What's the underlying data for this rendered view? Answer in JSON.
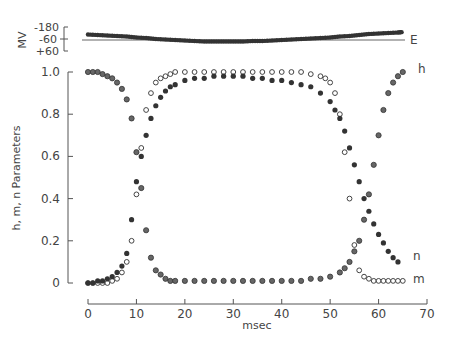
{
  "chart_data": {
    "type": "scatter",
    "title": "",
    "xlabel": "msec",
    "ylabel": "h, m, n  Parameters",
    "xlim": [
      0,
      70
    ],
    "ylim": [
      0,
      1.0
    ],
    "x_ticks": [
      "0",
      "10",
      "20",
      "30",
      "40",
      "50",
      "60",
      "70"
    ],
    "y_ticks": [
      "0",
      "0.2",
      "0.4",
      "0.6",
      "0.8",
      "1.0"
    ],
    "grid": false,
    "legend": "inline labels at right ends of curves",
    "series": [
      {
        "name": "h",
        "marker": "half-filled circle",
        "x": [
          0,
          1,
          2,
          3,
          4,
          5,
          6,
          7,
          8,
          9,
          10,
          11,
          12,
          13,
          14,
          15,
          16,
          17,
          18,
          20,
          22,
          24,
          26,
          28,
          30,
          32,
          34,
          36,
          38,
          40,
          42,
          44,
          46,
          48,
          50,
          52,
          53,
          54,
          55,
          56,
          57,
          58,
          59,
          60,
          61,
          62,
          63,
          64,
          65
        ],
        "values": [
          1.0,
          1.0,
          1.0,
          0.99,
          0.98,
          0.97,
          0.95,
          0.92,
          0.87,
          0.78,
          0.62,
          0.45,
          0.25,
          0.12,
          0.06,
          0.04,
          0.02,
          0.01,
          0.01,
          0.01,
          0.01,
          0.01,
          0.01,
          0.01,
          0.01,
          0.01,
          0.01,
          0.01,
          0.01,
          0.01,
          0.01,
          0.01,
          0.02,
          0.02,
          0.03,
          0.05,
          0.07,
          0.1,
          0.15,
          0.2,
          0.3,
          0.42,
          0.56,
          0.7,
          0.82,
          0.9,
          0.95,
          0.98,
          1.0
        ]
      },
      {
        "name": "m",
        "marker": "open circle",
        "x": [
          0,
          1,
          2,
          3,
          4,
          5,
          6,
          7,
          8,
          9,
          10,
          11,
          12,
          13,
          14,
          15,
          16,
          17,
          18,
          20,
          22,
          24,
          26,
          28,
          30,
          32,
          34,
          36,
          38,
          40,
          42,
          44,
          46,
          48,
          49,
          50,
          51,
          52,
          53,
          54,
          55,
          56,
          57,
          58,
          59,
          60,
          61,
          62,
          63,
          64,
          65
        ],
        "values": [
          0,
          0,
          0,
          0,
          0,
          0.01,
          0.02,
          0.05,
          0.1,
          0.2,
          0.42,
          0.64,
          0.82,
          0.9,
          0.95,
          0.97,
          0.98,
          0.99,
          1.0,
          1.0,
          1.0,
          1.0,
          1.0,
          1.0,
          1.0,
          1.0,
          1.0,
          1.0,
          1.0,
          1.0,
          1.0,
          1.0,
          0.99,
          0.98,
          0.97,
          0.95,
          0.9,
          0.8,
          0.62,
          0.4,
          0.18,
          0.06,
          0.03,
          0.02,
          0.01,
          0.01,
          0.01,
          0.01,
          0.01,
          0.01,
          0.01
        ]
      },
      {
        "name": "n",
        "marker": "filled circle",
        "x": [
          0,
          1,
          2,
          3,
          4,
          5,
          6,
          7,
          8,
          9,
          10,
          11,
          12,
          13,
          14,
          15,
          16,
          17,
          18,
          20,
          22,
          24,
          26,
          28,
          30,
          32,
          34,
          36,
          38,
          40,
          42,
          44,
          46,
          48,
          50,
          51,
          52,
          53,
          54,
          55,
          56,
          57,
          58,
          59,
          60,
          61,
          62,
          63,
          64
        ],
        "values": [
          0,
          0,
          0.01,
          0.01,
          0.02,
          0.03,
          0.05,
          0.08,
          0.14,
          0.3,
          0.48,
          0.6,
          0.7,
          0.78,
          0.84,
          0.88,
          0.91,
          0.93,
          0.94,
          0.96,
          0.97,
          0.97,
          0.98,
          0.98,
          0.98,
          0.98,
          0.97,
          0.97,
          0.96,
          0.96,
          0.95,
          0.94,
          0.93,
          0.9,
          0.86,
          0.82,
          0.78,
          0.72,
          0.64,
          0.56,
          0.48,
          0.4,
          0.34,
          0.28,
          0.23,
          0.19,
          0.15,
          0.12,
          0.1
        ]
      }
    ],
    "inset": {
      "ylabel": "MV",
      "y_ticks": [
        "-180",
        "-60",
        "+60"
      ],
      "ylim": [
        -180,
        60
      ],
      "reference_line_label": "E",
      "reference_line_value": -60,
      "trace_x": [
        0,
        2,
        4,
        6,
        8,
        10,
        12,
        14,
        16,
        18,
        20,
        22,
        24,
        26,
        28,
        30,
        32,
        34,
        36,
        38,
        40,
        42,
        44,
        46,
        48,
        50,
        52,
        54,
        56,
        58,
        60,
        62,
        64,
        65
      ],
      "trace_mv": [
        -105,
        -100,
        -95,
        -90,
        -85,
        -75,
        -70,
        -60,
        -55,
        -50,
        -45,
        -40,
        -35,
        -35,
        -35,
        -35,
        -35,
        -40,
        -40,
        -45,
        -50,
        -55,
        -60,
        -65,
        -70,
        -75,
        -85,
        -90,
        -100,
        -110,
        -115,
        -120,
        -125,
        -130
      ]
    }
  }
}
